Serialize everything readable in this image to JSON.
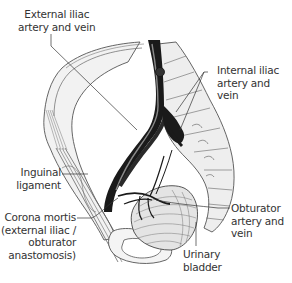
{
  "diagram": {
    "colors": {
      "background": "#ffffff",
      "outline": "#555555",
      "bone_fill": "#ececec",
      "vessel": "#1a1a1a",
      "vessel_highlight": "#8a8a8a",
      "label_text": "#333333",
      "leader_line": "#333333"
    },
    "labels": {
      "external_iliac": {
        "line1": "External iliac",
        "line2": "artery and vein"
      },
      "internal_iliac": {
        "line1": "Internal iliac",
        "line2": "artery and",
        "line3": "vein"
      },
      "inguinal_ligament": {
        "line1": "Inguinal",
        "line2": "ligament"
      },
      "corona_mortis": {
        "line1": "Corona mortis",
        "line2": "(external iliac /",
        "line3": "obturator",
        "line4": "anastomosis)"
      },
      "obturator": {
        "line1": "Obturator",
        "line2": "artery and",
        "line3": "vein"
      },
      "urinary_bladder": {
        "line1": "Urinary",
        "line2": "bladder"
      }
    }
  }
}
